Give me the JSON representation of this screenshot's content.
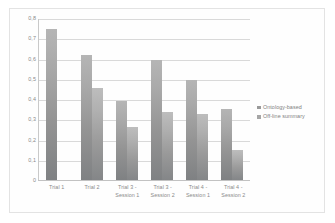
{
  "chart_data": {
    "type": "bar",
    "title": "",
    "xlabel": "",
    "ylabel": "",
    "ylim": [
      0,
      0.8
    ],
    "ytick_labels": [
      "0,8",
      "0,7",
      "0,6",
      "0,5",
      "0,4",
      "0,3",
      "0,2",
      "0,1",
      "0"
    ],
    "ytick_values": [
      0.8,
      0.7,
      0.6,
      0.5,
      0.4,
      0.3,
      0.2,
      0.1,
      0
    ],
    "grid": true,
    "legend_position": "right",
    "categories": [
      "Trial 1",
      "Trial 2",
      "Trial 3 - Session 1",
      "Trial 3 - Session 2",
      "Trial 4 - Session 1",
      "Trial 4 - Session 2"
    ],
    "category_lines": [
      [
        "Trial 1"
      ],
      [
        "Trial 2"
      ],
      [
        "Trial 3 -",
        "Session 1"
      ],
      [
        "Trial 3 -",
        "Session 2"
      ],
      [
        "Trial 4 -",
        "Session 1"
      ],
      [
        "Trial 4 -",
        "Session 2"
      ]
    ],
    "series": [
      {
        "name": "Ontology-based",
        "color": "#9a9a9a",
        "values": [
          0.75,
          0.62,
          0.395,
          0.595,
          0.495,
          0.355
        ]
      },
      {
        "name": "Off-line summary",
        "color": "#a6a6a6",
        "values": [
          null,
          0.455,
          0.265,
          0.34,
          0.33,
          0.15
        ]
      }
    ]
  },
  "legend": {
    "items": [
      {
        "label": "Ontology-based"
      },
      {
        "label": "Off-line summary"
      }
    ]
  }
}
